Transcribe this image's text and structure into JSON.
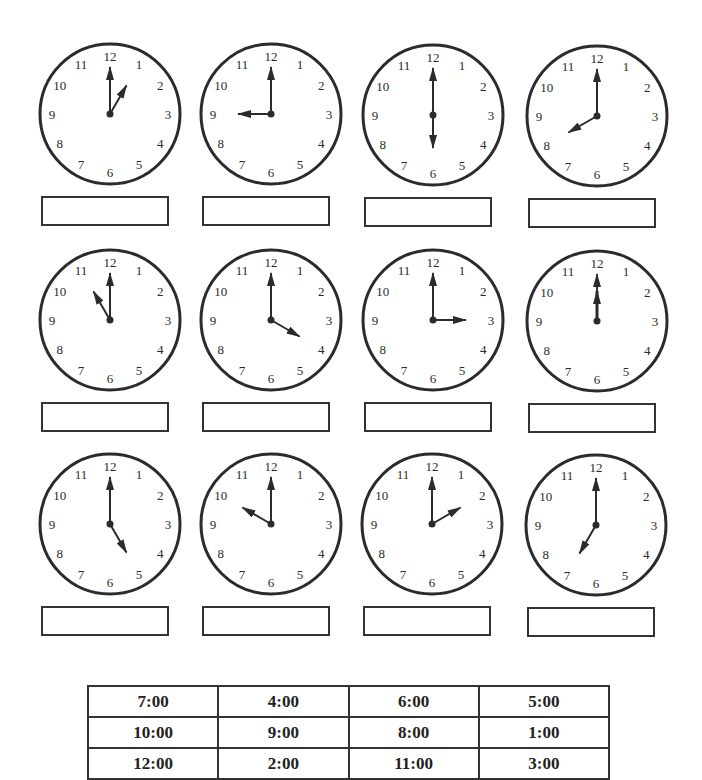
{
  "worksheet": {
    "clocks": [
      {
        "id": 1,
        "row": 1,
        "col": 1,
        "hour": 1,
        "minute": 0,
        "cx": 110,
        "cy": 114,
        "answer": ""
      },
      {
        "id": 2,
        "row": 1,
        "col": 2,
        "hour": 9,
        "minute": 0,
        "cx": 271,
        "cy": 114,
        "answer": ""
      },
      {
        "id": 3,
        "row": 1,
        "col": 3,
        "hour": 6,
        "minute": 0,
        "cx": 433,
        "cy": 115,
        "answer": ""
      },
      {
        "id": 4,
        "row": 1,
        "col": 4,
        "hour": 8,
        "minute": 0,
        "cx": 597,
        "cy": 116,
        "answer": ""
      },
      {
        "id": 5,
        "row": 2,
        "col": 1,
        "hour": 11,
        "minute": 0,
        "cx": 110,
        "cy": 320,
        "answer": ""
      },
      {
        "id": 6,
        "row": 2,
        "col": 2,
        "hour": 4,
        "minute": 0,
        "cx": 271,
        "cy": 320,
        "answer": ""
      },
      {
        "id": 7,
        "row": 2,
        "col": 3,
        "hour": 3,
        "minute": 0,
        "cx": 433,
        "cy": 320,
        "answer": ""
      },
      {
        "id": 8,
        "row": 2,
        "col": 4,
        "hour": 12,
        "minute": 0,
        "cx": 597,
        "cy": 321,
        "answer": ""
      },
      {
        "id": 9,
        "row": 3,
        "col": 1,
        "hour": 5,
        "minute": 0,
        "cx": 110,
        "cy": 524,
        "answer": ""
      },
      {
        "id": 10,
        "row": 3,
        "col": 2,
        "hour": 10,
        "minute": 0,
        "cx": 271,
        "cy": 524,
        "answer": ""
      },
      {
        "id": 11,
        "row": 3,
        "col": 3,
        "hour": 2,
        "minute": 0,
        "cx": 432,
        "cy": 524,
        "answer": ""
      },
      {
        "id": 12,
        "row": 3,
        "col": 4,
        "hour": 7,
        "minute": 0,
        "cx": 596,
        "cy": 525,
        "answer": ""
      }
    ],
    "dial_numbers": [
      "12",
      "1",
      "2",
      "3",
      "4",
      "5",
      "6",
      "7",
      "8",
      "9",
      "10",
      "11"
    ],
    "answer_bank": [
      [
        "7:00",
        "4:00",
        "6:00",
        "5:00"
      ],
      [
        "10:00",
        "9:00",
        "8:00",
        "1:00"
      ],
      [
        "12:00",
        "2:00",
        "11:00",
        "3:00"
      ]
    ]
  },
  "colors": {
    "ink": "#2b2b2b",
    "paper": "#ffffff"
  }
}
